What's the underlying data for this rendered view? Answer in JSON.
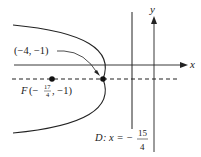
{
  "diagram": {
    "axes": {
      "x_label": "x",
      "y_label": "y"
    },
    "vertex": {
      "label": "(−4, −1)"
    },
    "focus": {
      "prefix": "F",
      "open": "(−",
      "num": "17",
      "den": "4",
      "rest": ", −1)"
    },
    "directrix": {
      "prefix": "D",
      "eq": ": x = −",
      "num": "15",
      "den": "4"
    },
    "colors": {
      "stroke": "#222222"
    }
  }
}
